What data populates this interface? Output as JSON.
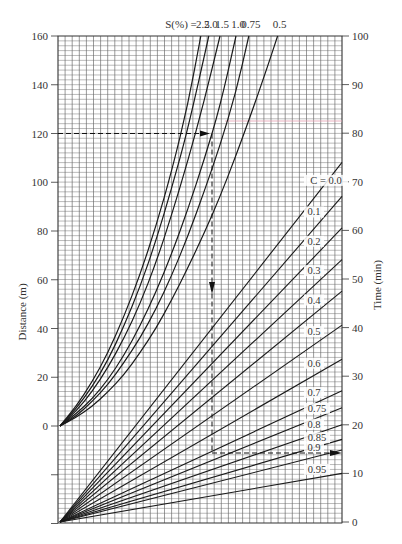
{
  "chart_data": {
    "type": "line",
    "title": "",
    "top_label_prefix": "S(%) = ",
    "left_axis": {
      "label": "Distance (m)",
      "ticks": [
        160,
        140,
        120,
        100,
        80,
        60,
        40,
        20,
        0
      ],
      "unlabeled_ticks": [
        -20,
        -40
      ],
      "range": [
        -40,
        160
      ]
    },
    "right_axis": {
      "label": "Time (min)",
      "ticks": [
        100,
        90,
        80,
        70,
        60,
        50,
        40,
        30,
        20,
        10,
        0
      ],
      "range": [
        0,
        100
      ]
    },
    "grid": true,
    "slope_series": [
      {
        "name": "2.5",
        "points": [
          [
            0,
            0
          ],
          [
            10,
            8
          ],
          [
            20,
            18
          ],
          [
            30,
            30
          ],
          [
            40,
            45
          ],
          [
            50,
            62
          ],
          [
            60,
            82
          ],
          [
            70,
            105
          ],
          [
            80,
            132
          ],
          [
            88,
            160
          ]
        ]
      },
      {
        "name": "2.0",
        "points": [
          [
            0,
            0
          ],
          [
            10,
            7
          ],
          [
            20,
            16
          ],
          [
            30,
            27
          ],
          [
            40,
            41
          ],
          [
            50,
            57
          ],
          [
            60,
            76
          ],
          [
            70,
            98
          ],
          [
            80,
            122
          ],
          [
            93,
            160
          ]
        ]
      },
      {
        "name": "1.5",
        "points": [
          [
            0,
            0
          ],
          [
            10,
            6
          ],
          [
            20,
            14
          ],
          [
            30,
            24
          ],
          [
            40,
            36
          ],
          [
            50,
            50
          ],
          [
            60,
            67
          ],
          [
            70,
            87
          ],
          [
            80,
            109
          ],
          [
            90,
            133
          ],
          [
            100,
            160
          ]
        ]
      },
      {
        "name": "1.0",
        "points": [
          [
            0,
            0
          ],
          [
            10,
            5
          ],
          [
            20,
            11
          ],
          [
            30,
            19
          ],
          [
            40,
            29
          ],
          [
            50,
            41
          ],
          [
            60,
            55
          ],
          [
            70,
            71
          ],
          [
            80,
            89
          ],
          [
            90,
            109
          ],
          [
            100,
            131
          ],
          [
            110,
            160
          ]
        ]
      },
      {
        "name": "0.75",
        "points": [
          [
            0,
            0
          ],
          [
            10,
            4
          ],
          [
            20,
            10
          ],
          [
            30,
            17
          ],
          [
            40,
            26
          ],
          [
            50,
            36
          ],
          [
            60,
            48
          ],
          [
            70,
            62
          ],
          [
            80,
            78
          ],
          [
            90,
            96
          ],
          [
            100,
            115
          ],
          [
            110,
            137
          ],
          [
            118,
            160
          ]
        ]
      },
      {
        "name": "0.5",
        "points": [
          [
            0,
            0
          ],
          [
            10,
            3.5
          ],
          [
            20,
            8
          ],
          [
            30,
            14
          ],
          [
            40,
            21
          ],
          [
            50,
            30
          ],
          [
            60,
            40
          ],
          [
            70,
            52
          ],
          [
            80,
            65
          ],
          [
            90,
            79
          ],
          [
            100,
            94
          ],
          [
            110,
            111
          ],
          [
            120,
            129
          ],
          [
            130,
            148
          ],
          [
            136,
            160
          ]
        ]
      }
    ],
    "runoff_series": [
      {
        "name": "C = 0.0",
        "end_time_min": 74
      },
      {
        "name": "0.1",
        "end_time_min": 67
      },
      {
        "name": "0.2",
        "end_time_min": 60.5
      },
      {
        "name": "0.3",
        "end_time_min": 54
      },
      {
        "name": "0.4",
        "end_time_min": 47.5
      },
      {
        "name": "0.5",
        "end_time_min": 40.5
      },
      {
        "name": "0.6",
        "end_time_min": 33.5
      },
      {
        "name": "0.7",
        "end_time_min": 27
      },
      {
        "name": "0.75",
        "end_time_min": 23.5
      },
      {
        "name": "0.8",
        "end_time_min": 20
      },
      {
        "name": "0.85",
        "end_time_min": 17
      },
      {
        "name": "0.9",
        "end_time_min": 14.8
      },
      {
        "name": "0.95",
        "end_time_min": 10
      }
    ],
    "example_path": {
      "distance_m": 120,
      "slope_pct": 1.5,
      "runoff_c": 0.9,
      "result_time_min": 14
    }
  }
}
